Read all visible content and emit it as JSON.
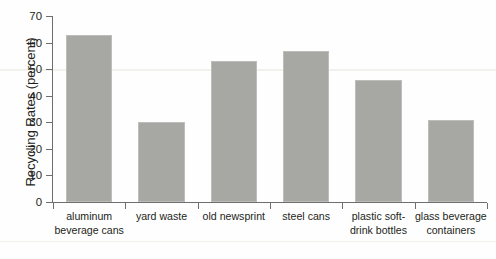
{
  "chart_data": {
    "type": "bar",
    "title": "",
    "xlabel": "",
    "ylabel": "Recycling Rates (percent)",
    "categories": [
      "aluminum beverage cans",
      "yard waste",
      "old newsprint",
      "steel cans",
      "plastic soft-drink bottles",
      "glass beverage containers"
    ],
    "category_lines": [
      [
        "aluminum",
        "beverage cans"
      ],
      [
        "yard waste"
      ],
      [
        "old newsprint"
      ],
      [
        "steel cans"
      ],
      [
        "plastic soft-",
        "drink bottles"
      ],
      [
        "glass beverage",
        "containers"
      ]
    ],
    "values": [
      63,
      30,
      53,
      57,
      46,
      31
    ],
    "ylim": [
      0,
      70
    ],
    "yticks": [
      0,
      10,
      20,
      30,
      40,
      50,
      60,
      70
    ],
    "ytick_labels": [
      "0",
      "10",
      "20",
      "30",
      "40",
      "50",
      "60",
      "70"
    ],
    "grid": false,
    "legend": false,
    "bar_color": "#a7a7a3",
    "axis_color": "#6d6e70",
    "text_color": "#231f20",
    "background_color": "#fefefe"
  }
}
